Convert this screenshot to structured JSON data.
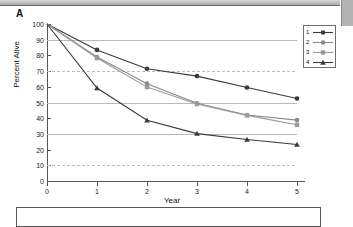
{
  "panel": {
    "label": "A"
  },
  "chart_data": {
    "type": "line",
    "title": "",
    "xlabel": "Year",
    "ylabel": "Percent Alive",
    "x": [
      0,
      1,
      2,
      3,
      4,
      5
    ],
    "xlim": [
      0,
      5
    ],
    "ylim": [
      0,
      100
    ],
    "xticks": [
      "0",
      "1",
      "2",
      "3",
      "4",
      "5"
    ],
    "yticks": [
      "0",
      "10",
      "20",
      "30",
      "40",
      "50",
      "60",
      "70",
      "80",
      "90",
      "100"
    ],
    "gridlines_at": [
      10,
      30,
      50,
      70,
      90
    ],
    "grid": true,
    "legend_position": "top-right",
    "series": [
      {
        "name": "1",
        "label": "1",
        "marker": "circle",
        "color": "#3a3a3a",
        "values": [
          100,
          83.5,
          71.5,
          66.8,
          59.6,
          52.5
        ]
      },
      {
        "name": "2",
        "label": "2",
        "marker": "circle",
        "color": "#8a8a8a",
        "values": [
          100,
          79.0,
          62.0,
          49.5,
          42.0,
          38.8
        ]
      },
      {
        "name": "3",
        "label": "3",
        "marker": "square",
        "color": "#9a9a9a",
        "values": [
          100,
          78.3,
          59.8,
          49.0,
          41.8,
          35.8
        ]
      },
      {
        "name": "4",
        "label": "4",
        "marker": "triangle",
        "color": "#3a3a3a",
        "values": [
          100,
          59.2,
          38.7,
          30.2,
          26.4,
          23.2
        ]
      }
    ]
  },
  "legend": {
    "entries": [
      {
        "label": "1"
      },
      {
        "label": "2"
      },
      {
        "label": "3"
      },
      {
        "label": "4"
      }
    ]
  },
  "colors": {
    "axis": "#555555",
    "grid": "#b9b9b9",
    "dark_series": "#3a3a3a",
    "light_series": "#8a8a8a"
  }
}
